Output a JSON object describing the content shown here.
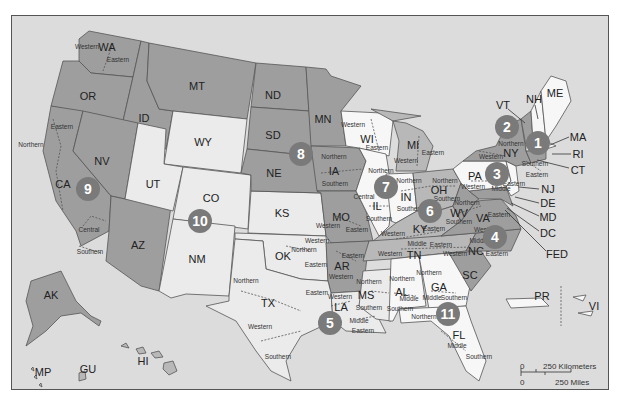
{
  "colors": {
    "background": "#dcdcdc",
    "circuit_dark": "#9e9e9e",
    "circuit_mid": "#b8b8b8",
    "circuit_light": "#ebebeb",
    "circuit_white": "#f7f7f7",
    "circuit_badge": "#7a7a7a"
  },
  "circuits": [
    {
      "number": "1",
      "x": 537,
      "y": 142
    },
    {
      "number": "2",
      "x": 506,
      "y": 126
    },
    {
      "number": "3",
      "x": 496,
      "y": 173
    },
    {
      "number": "4",
      "x": 494,
      "y": 236
    },
    {
      "number": "5",
      "x": 329,
      "y": 322
    },
    {
      "number": "6",
      "x": 429,
      "y": 210
    },
    {
      "number": "7",
      "x": 385,
      "y": 186
    },
    {
      "number": "8",
      "x": 300,
      "y": 153
    },
    {
      "number": "9",
      "x": 87,
      "y": 188
    },
    {
      "number": "10",
      "x": 199,
      "y": 220
    },
    {
      "number": "11",
      "x": 447,
      "y": 313
    }
  ],
  "states": [
    {
      "abbr": "WA",
      "x": 106,
      "y": 46
    },
    {
      "abbr": "OR",
      "x": 87,
      "y": 95
    },
    {
      "abbr": "CA",
      "x": 62,
      "y": 183
    },
    {
      "abbr": "NV",
      "x": 101,
      "y": 160
    },
    {
      "abbr": "ID",
      "x": 143,
      "y": 117
    },
    {
      "abbr": "MT",
      "x": 196,
      "y": 85
    },
    {
      "abbr": "WY",
      "x": 202,
      "y": 141
    },
    {
      "abbr": "UT",
      "x": 152,
      "y": 183
    },
    {
      "abbr": "CO",
      "x": 210,
      "y": 197
    },
    {
      "abbr": "AZ",
      "x": 137,
      "y": 244
    },
    {
      "abbr": "NM",
      "x": 196,
      "y": 258
    },
    {
      "abbr": "ND",
      "x": 272,
      "y": 94
    },
    {
      "abbr": "SD",
      "x": 272,
      "y": 134
    },
    {
      "abbr": "NE",
      "x": 273,
      "y": 172
    },
    {
      "abbr": "KS",
      "x": 281,
      "y": 212
    },
    {
      "abbr": "OK",
      "x": 282,
      "y": 255
    },
    {
      "abbr": "TX",
      "x": 267,
      "y": 302
    },
    {
      "abbr": "MN",
      "x": 322,
      "y": 118
    },
    {
      "abbr": "IA",
      "x": 333,
      "y": 170
    },
    {
      "abbr": "MO",
      "x": 340,
      "y": 216
    },
    {
      "abbr": "AR",
      "x": 341,
      "y": 265
    },
    {
      "abbr": "LA",
      "x": 340,
      "y": 306
    },
    {
      "abbr": "WI",
      "x": 366,
      "y": 138
    },
    {
      "abbr": "IL",
      "x": 376,
      "y": 205
    },
    {
      "abbr": "MI",
      "x": 412,
      "y": 144
    },
    {
      "abbr": "IN",
      "x": 405,
      "y": 196
    },
    {
      "abbr": "OH",
      "x": 438,
      "y": 189
    },
    {
      "abbr": "KY",
      "x": 419,
      "y": 228
    },
    {
      "abbr": "TN",
      "x": 413,
      "y": 254
    },
    {
      "abbr": "MS",
      "x": 365,
      "y": 294
    },
    {
      "abbr": "AL",
      "x": 401,
      "y": 291
    },
    {
      "abbr": "GA",
      "x": 438,
      "y": 286
    },
    {
      "abbr": "FL",
      "x": 458,
      "y": 334
    },
    {
      "abbr": "SC",
      "x": 469,
      "y": 274
    },
    {
      "abbr": "NC",
      "x": 475,
      "y": 250
    },
    {
      "abbr": "VA",
      "x": 482,
      "y": 217
    },
    {
      "abbr": "WV",
      "x": 458,
      "y": 212
    },
    {
      "abbr": "PA",
      "x": 474,
      "y": 175
    },
    {
      "abbr": "NY",
      "x": 510,
      "y": 152
    },
    {
      "abbr": "VT",
      "x": 502,
      "y": 104
    },
    {
      "abbr": "NH",
      "x": 533,
      "y": 98
    },
    {
      "abbr": "ME",
      "x": 554,
      "y": 92
    },
    {
      "abbr": "AK",
      "x": 50,
      "y": 294
    },
    {
      "abbr": "HI",
      "x": 142,
      "y": 360
    },
    {
      "abbr": "GU",
      "x": 87,
      "y": 368
    },
    {
      "abbr": "MP",
      "x": 42,
      "y": 371
    },
    {
      "abbr": "PR",
      "x": 541,
      "y": 295
    },
    {
      "abbr": "VI",
      "x": 593,
      "y": 305
    }
  ],
  "callout_states": [
    {
      "abbr": "MA",
      "x": 577,
      "y": 136,
      "tx": 549,
      "ty": 144
    },
    {
      "abbr": "RI",
      "x": 577,
      "y": 153,
      "tx": 551,
      "ty": 153
    },
    {
      "abbr": "CT",
      "x": 577,
      "y": 169,
      "tx": 536,
      "ty": 159
    },
    {
      "abbr": "NJ",
      "x": 547,
      "y": 188,
      "tx": 528,
      "ty": 187
    },
    {
      "abbr": "DE",
      "x": 547,
      "y": 202,
      "tx": 522,
      "ty": 197
    },
    {
      "abbr": "MD",
      "x": 547,
      "y": 216,
      "tx": 518,
      "ty": 204
    },
    {
      "abbr": "DC",
      "x": 547,
      "y": 232,
      "tx": 511,
      "ty": 208
    },
    {
      "abbr": "FED",
      "x": 556,
      "y": 253,
      "tx": 509,
      "ty": 210
    }
  ],
  "districts": [
    {
      "name": "Western",
      "x": 86,
      "y": 46
    },
    {
      "name": "Eastern",
      "x": 117,
      "y": 59
    },
    {
      "name": "Eastern",
      "x": 61,
      "y": 126
    },
    {
      "name": "Northern",
      "x": 30,
      "y": 144
    },
    {
      "name": "Central",
      "x": 88,
      "y": 229
    },
    {
      "name": "Southern",
      "x": 89,
      "y": 251
    },
    {
      "name": "Northern",
      "x": 333,
      "y": 156
    },
    {
      "name": "Southern",
      "x": 334,
      "y": 183
    },
    {
      "name": "Western",
      "x": 352,
      "y": 124
    },
    {
      "name": "Eastern",
      "x": 376,
      "y": 147
    },
    {
      "name": "Western",
      "x": 405,
      "y": 160
    },
    {
      "name": "Eastern",
      "x": 432,
      "y": 152
    },
    {
      "name": "Northern",
      "x": 380,
      "y": 170
    },
    {
      "name": "Central",
      "x": 363,
      "y": 196
    },
    {
      "name": "Southern",
      "x": 378,
      "y": 218
    },
    {
      "name": "Northern",
      "x": 408,
      "y": 180
    },
    {
      "name": "Southern",
      "x": 409,
      "y": 208
    },
    {
      "name": "Northern",
      "x": 444,
      "y": 180
    },
    {
      "name": "Southern",
      "x": 446,
      "y": 198
    },
    {
      "name": "Western",
      "x": 472,
      "y": 186
    },
    {
      "name": "Middle",
      "x": 500,
      "y": 188
    },
    {
      "name": "Eastern",
      "x": 513,
      "y": 183
    },
    {
      "name": "Western",
      "x": 490,
      "y": 156
    },
    {
      "name": "Northern",
      "x": 510,
      "y": 143
    },
    {
      "name": "Southern",
      "x": 534,
      "y": 163
    },
    {
      "name": "Eastern",
      "x": 536,
      "y": 174
    },
    {
      "name": "Northern",
      "x": 466,
      "y": 202
    },
    {
      "name": "Southern",
      "x": 458,
      "y": 221
    },
    {
      "name": "Eastern",
      "x": 498,
      "y": 214
    },
    {
      "name": "Western",
      "x": 485,
      "y": 229
    },
    {
      "name": "Western",
      "x": 392,
      "y": 233
    },
    {
      "name": "Eastern",
      "x": 433,
      "y": 228
    },
    {
      "name": "Western",
      "x": 389,
      "y": 253
    },
    {
      "name": "Middle",
      "x": 416,
      "y": 243
    },
    {
      "name": "Eastern",
      "x": 440,
      "y": 244
    },
    {
      "name": "Western",
      "x": 454,
      "y": 253
    },
    {
      "name": "Middle",
      "x": 478,
      "y": 240
    },
    {
      "name": "Eastern",
      "x": 496,
      "y": 253
    },
    {
      "name": "Western",
      "x": 327,
      "y": 225
    },
    {
      "name": "Eastern",
      "x": 356,
      "y": 229
    },
    {
      "name": "Eastern",
      "x": 352,
      "y": 255
    },
    {
      "name": "Western",
      "x": 340,
      "y": 276
    },
    {
      "name": "Northern",
      "x": 303,
      "y": 249
    },
    {
      "name": "Western",
      "x": 316,
      "y": 240
    },
    {
      "name": "Eastern",
      "x": 315,
      "y": 264
    },
    {
      "name": "Northern",
      "x": 245,
      "y": 280
    },
    {
      "name": "Eastern",
      "x": 316,
      "y": 292
    },
    {
      "name": "Western",
      "x": 259,
      "y": 326
    },
    {
      "name": "Southern",
      "x": 277,
      "y": 356
    },
    {
      "name": "Western",
      "x": 339,
      "y": 296
    },
    {
      "name": "Middle",
      "x": 358,
      "y": 320
    },
    {
      "name": "Eastern",
      "x": 362,
      "y": 330
    },
    {
      "name": "Northern",
      "x": 368,
      "y": 281
    },
    {
      "name": "Southern",
      "x": 368,
      "y": 307
    },
    {
      "name": "Northern",
      "x": 401,
      "y": 278
    },
    {
      "name": "Middle",
      "x": 408,
      "y": 298
    },
    {
      "name": "Southern",
      "x": 399,
      "y": 308
    },
    {
      "name": "Northern",
      "x": 423,
      "y": 316
    },
    {
      "name": "Northern",
      "x": 428,
      "y": 272
    },
    {
      "name": "Middle",
      "x": 431,
      "y": 297
    },
    {
      "name": "Southern",
      "x": 453,
      "y": 297
    },
    {
      "name": "Middle",
      "x": 456,
      "y": 345
    },
    {
      "name": "Southern",
      "x": 478,
      "y": 356
    }
  ],
  "scale_bar": {
    "km_zero": "0",
    "km_label": "250 Kilometers",
    "mi_zero": "0",
    "mi_label": "250 Miles"
  }
}
